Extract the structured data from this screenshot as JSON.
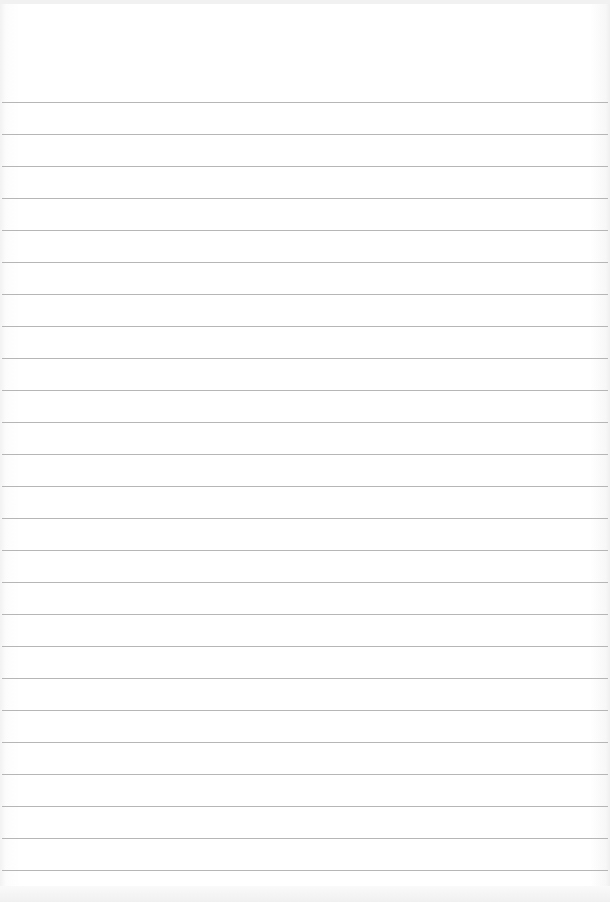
{
  "page": {
    "type": "lined-paper",
    "background_color": "#ffffff",
    "line_color": "#a9a9a9",
    "first_line_y": 102,
    "line_spacing": 32,
    "line_count": 25,
    "text": []
  }
}
